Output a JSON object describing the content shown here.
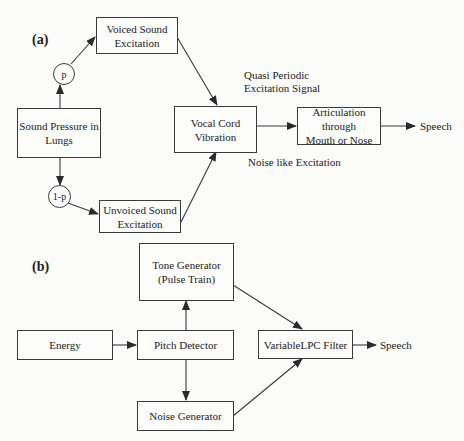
{
  "diagram_a": {
    "panel_label": "(a)",
    "nodes": {
      "voiced": {
        "line1": "Voiced Sound",
        "line2": "Excitation"
      },
      "p": "p",
      "lungs": {
        "line1": "Sound Pressure in",
        "line2": "Lungs"
      },
      "one_minus_p": "1-p",
      "unvoiced": {
        "line1": "Unvoiced Sound",
        "line2": "Excitation"
      },
      "vocal_cord": "Vocal Cord Vibration",
      "articulation": {
        "line1": "Articulation through",
        "line2": "Mouth or Nose"
      },
      "speech": "Speech"
    },
    "annotations": {
      "quasi_line1": "Quasi Periodic",
      "quasi_line2": "Excitation Signal",
      "noise": "Noise like Excitation"
    },
    "edges": [
      [
        "lungs",
        "p"
      ],
      [
        "p",
        "voiced"
      ],
      [
        "lungs",
        "one_minus_p"
      ],
      [
        "one_minus_p",
        "unvoiced"
      ],
      [
        "voiced",
        "vocal_cord"
      ],
      [
        "unvoiced",
        "vocal_cord"
      ],
      [
        "vocal_cord",
        "articulation"
      ],
      [
        "articulation",
        "speech"
      ]
    ]
  },
  "diagram_b": {
    "panel_label": "(b)",
    "nodes": {
      "tone": {
        "line1": "Tone Generator",
        "line2": "(Pulse Train)"
      },
      "energy": "Energy",
      "pitch": "Pitch Detector",
      "noise": "Noise Generator",
      "lpc": "VariableLPC Filter",
      "speech": "Speech"
    },
    "edges": [
      [
        "energy",
        "pitch"
      ],
      [
        "pitch",
        "tone"
      ],
      [
        "pitch",
        "noise"
      ],
      [
        "tone",
        "lpc"
      ],
      [
        "noise",
        "lpc"
      ],
      [
        "lpc",
        "speech"
      ]
    ]
  },
  "colors": {
    "line": "#3a3a3a",
    "background": "#fbfbfa",
    "text": "#222222"
  }
}
